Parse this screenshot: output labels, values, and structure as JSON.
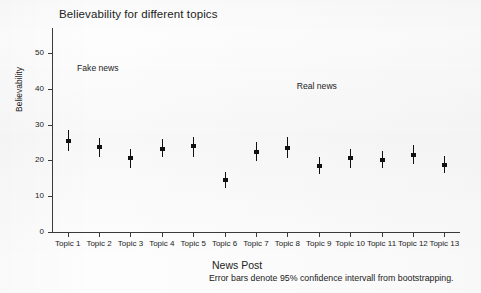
{
  "chart_data": {
    "type": "scatter",
    "title": "Believability for different topics",
    "xlabel": "News Post",
    "ylabel": "Believability",
    "caption": "Error bars denote 95% confidence intervall from bootstrapping.",
    "grid": false,
    "legend_position": "none",
    "ylim": [
      0,
      57
    ],
    "yticks": [
      0,
      10,
      20,
      30,
      40,
      50
    ],
    "ytick_labels": [
      "0",
      "10",
      "20",
      "30",
      "40",
      "50"
    ],
    "categories": [
      "Topic 1",
      "Topic 2",
      "Topic 3",
      "Topic 4",
      "Topic 5",
      "Topic 6",
      "Topic 7",
      "Topic 8",
      "Topic 9",
      "Topic 10",
      "Topic 11",
      "Topic 12",
      "Topic 13"
    ],
    "series": [
      {
        "name": "Believability mean with 95% CI",
        "values": [
          25.5,
          23.8,
          20.6,
          23.3,
          23.9,
          14.5,
          22.3,
          23.6,
          18.4,
          20.6,
          20.2,
          21.6,
          18.7
        ],
        "ci_low": [
          22.5,
          21.0,
          17.9,
          20.9,
          20.9,
          12.4,
          19.8,
          20.7,
          16.2,
          18.0,
          17.9,
          18.9,
          16.4
        ],
        "ci_high": [
          28.5,
          26.4,
          23.3,
          25.9,
          26.6,
          16.7,
          25.2,
          26.5,
          21.0,
          23.3,
          22.5,
          24.3,
          21.2
        ]
      }
    ],
    "annotations": [
      {
        "text": "Fake news",
        "x_value": "Topic 2",
        "y_value": 45.5
      },
      {
        "text": "Real news",
        "x_value": "Topic 9",
        "y_value": 40.5
      }
    ]
  }
}
